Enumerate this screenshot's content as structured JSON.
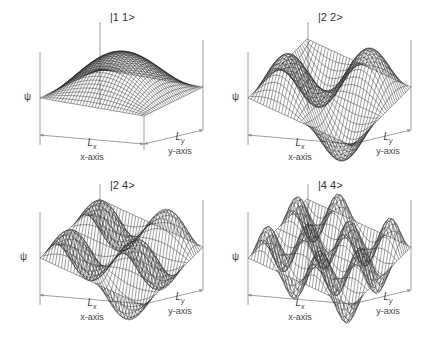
{
  "figure": {
    "panels": [
      {
        "state_label": "|1 1>",
        "nx": 1,
        "ny": 1,
        "psi_label": "ψ",
        "x_dim": "L",
        "x_sub": "x",
        "x_axis": "x-axis",
        "y_dim": "L",
        "y_sub": "y",
        "y_axis": "y-axis"
      },
      {
        "state_label": "|2 2>",
        "nx": 2,
        "ny": 2,
        "psi_label": "ψ",
        "x_dim": "L",
        "x_sub": "x",
        "x_axis": "x-axis",
        "y_dim": "L",
        "y_sub": "y",
        "y_axis": "y-axis"
      },
      {
        "state_label": "|2 4>",
        "nx": 2,
        "ny": 4,
        "psi_label": "ψ",
        "x_dim": "L",
        "x_sub": "x",
        "x_axis": "x-axis",
        "y_dim": "L",
        "y_sub": "y",
        "y_axis": "y-axis"
      },
      {
        "state_label": "|4 4>",
        "nx": 4,
        "ny": 4,
        "psi_label": "ψ",
        "x_dim": "L",
        "x_sub": "x",
        "x_axis": "x-axis",
        "y_dim": "L",
        "y_sub": "y",
        "y_axis": "y-axis"
      }
    ]
  },
  "colors": {
    "mesh": "#2b2b2b",
    "axis": "#888888",
    "background": "#ffffff"
  }
}
